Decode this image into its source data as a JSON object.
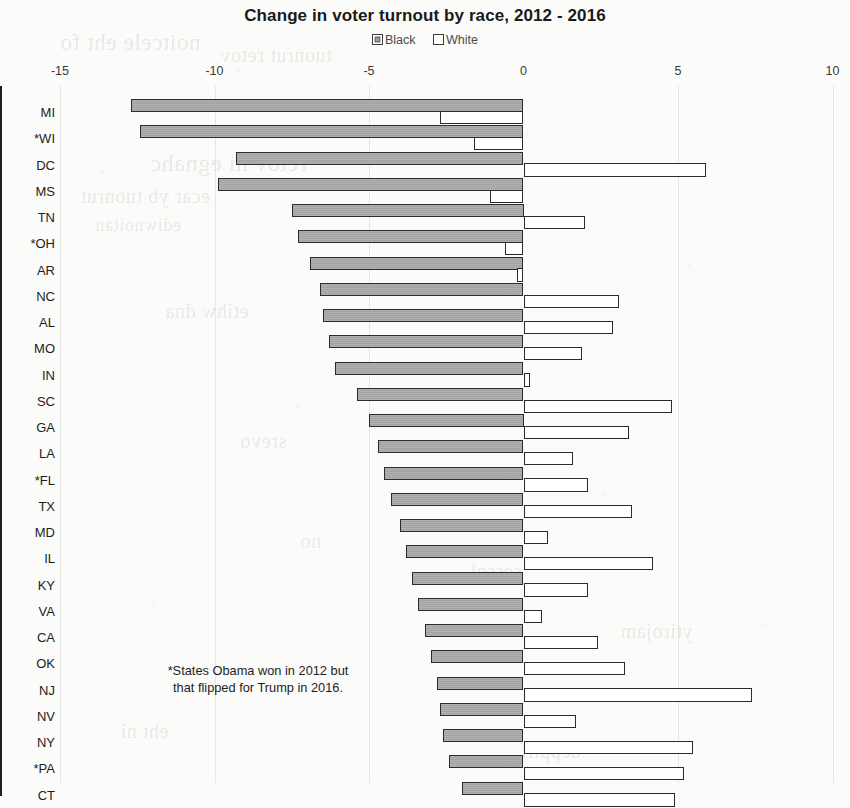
{
  "chart_data": {
    "type": "bar",
    "orientation": "horizontal",
    "title": "Change in voter turnout by race, 2012 - 2016",
    "xlabel": "",
    "ylabel": "",
    "xlim": [
      -15,
      10
    ],
    "xticks": [
      -15,
      -10,
      -5,
      0,
      5,
      10
    ],
    "xtick_labels": [
      "-15",
      "-10",
      "-5",
      "0",
      "5",
      "10"
    ],
    "grid": false,
    "legend_position": "top-center",
    "legend": [
      "Black",
      "White"
    ],
    "annotation": "*States Obama won in 2012 but that flipped for Trump in 2016.",
    "note_marker": "*",
    "colors": {
      "black_series": "#a8a8a8",
      "white_series": "#ffffff",
      "bar_outline": "#2b2b2b",
      "axis": "#1f1f1f"
    },
    "categories": [
      "MI",
      "*WI",
      "DC",
      "MS",
      "TN",
      "*OH",
      "AR",
      "NC",
      "AL",
      "MO",
      "IN",
      "SC",
      "GA",
      "LA",
      "*FL",
      "TX",
      "MD",
      "IL",
      "KY",
      "VA",
      "CA",
      "OK",
      "NJ",
      "NV",
      "NY",
      "*PA",
      "CT"
    ],
    "series": [
      {
        "name": "Black",
        "values": [
          -12.7,
          -12.4,
          -9.3,
          -9.9,
          -7.5,
          -7.3,
          -6.9,
          -6.6,
          -6.5,
          -6.3,
          -6.1,
          -5.4,
          -5.0,
          -4.7,
          -4.5,
          -4.3,
          -4.0,
          -3.8,
          -3.6,
          -3.4,
          -3.2,
          -3.0,
          -2.8,
          -2.7,
          -2.6,
          -2.4,
          -2.0
        ]
      },
      {
        "name": "White",
        "values": [
          -2.7,
          -1.6,
          5.9,
          -1.1,
          2.0,
          -0.6,
          -0.2,
          3.1,
          2.9,
          1.9,
          0.2,
          4.8,
          3.4,
          1.6,
          2.1,
          3.5,
          0.8,
          4.2,
          2.1,
          0.6,
          2.4,
          3.3,
          7.4,
          1.7,
          5.5,
          5.2,
          4.9
        ]
      }
    ]
  },
  "chart": {
    "title": "Change in voter turnout by race, 2012 - 2016",
    "legend": [
      {
        "label": "Black",
        "swatch": "filled-gray-square"
      },
      {
        "label": "White",
        "swatch": "open-white-square"
      }
    ],
    "annotation_line1": "*States Obama won in 2012 but",
    "annotation_line2": "that flipped for Trump in 2016."
  }
}
